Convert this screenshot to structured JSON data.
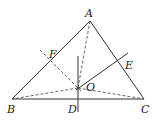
{
  "diagram": {
    "type": "geometry-triangle",
    "stroke_color": "#333333",
    "points": {
      "A": {
        "label": "A",
        "x": 90,
        "y": 21
      },
      "B": {
        "label": "B",
        "x": 12,
        "y": 99
      },
      "C": {
        "label": "C",
        "x": 144,
        "y": 99
      },
      "O": {
        "label": "O",
        "x": 78,
        "y": 88
      },
      "D": {
        "label": "D",
        "x": 78,
        "y": 99
      },
      "E": {
        "label": "E",
        "x": 118,
        "y": 61
      },
      "F": {
        "label": "F",
        "x": 51,
        "y": 60
      }
    },
    "labels": {
      "A": "A",
      "B": "B",
      "C": "C",
      "D": "D",
      "E": "E",
      "F": "F",
      "O": "O"
    },
    "segments": {
      "solid": [
        "AB",
        "AC",
        "BC",
        "perpendicular bisector through D",
        "perpendicular bisector through E"
      ],
      "dashed": [
        "OA",
        "OB",
        "OC",
        "perpendicular bisector through F"
      ]
    }
  }
}
